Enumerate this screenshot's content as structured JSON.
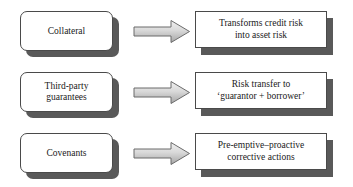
{
  "diagram": {
    "type": "process-flow",
    "title": "",
    "colors": {
      "box_fill": "#ffffff",
      "box_border": "#4a4a4a",
      "shadow": "#595959",
      "arrow_fill_light": "#e8e8e8",
      "arrow_fill_dark": "#a8a8a8",
      "arrow_border": "#6b6b6b",
      "text": "#1a1a1a",
      "background": "#ffffff"
    },
    "rows": [
      {
        "id": "row-collateral",
        "source": {
          "label": "Collateral",
          "lines": [
            "Collateral"
          ]
        },
        "connector": {
          "icon": "right-arrow-icon",
          "direction": "right"
        },
        "target": {
          "label": "Transforms credit risk into asset risk",
          "lines": [
            "Transforms credit risk",
            "into asset risk"
          ]
        }
      },
      {
        "id": "row-third-party-guarantees",
        "source": {
          "label": "Third-party guarantees",
          "lines": [
            "Third-party",
            "guarantees"
          ]
        },
        "connector": {
          "icon": "right-arrow-icon",
          "direction": "right"
        },
        "target": {
          "label": "Risk transfer to ‘guarantor + borrower’",
          "lines": [
            "Risk transfer to",
            "‘guarantor + borrower’"
          ]
        }
      },
      {
        "id": "row-covenants",
        "source": {
          "label": "Covenants",
          "lines": [
            "Covenants"
          ]
        },
        "connector": {
          "icon": "right-arrow-icon",
          "direction": "right"
        },
        "target": {
          "label": "Pre-emptive–proactive corrective actions",
          "lines": [
            "Pre-emptive–proactive",
            "corrective actions"
          ]
        }
      }
    ]
  }
}
